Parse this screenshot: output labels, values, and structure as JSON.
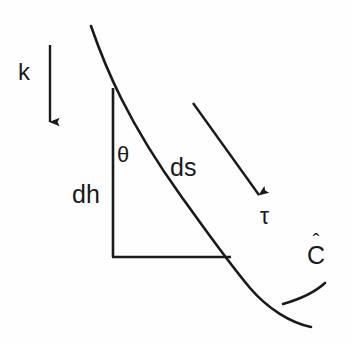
{
  "figure": {
    "type": "line-diagram",
    "background_color": "#fefefe",
    "stroke_color": "#1a1a1a",
    "labels": {
      "k": "k",
      "dh": "dh",
      "theta": "θ",
      "ds": "ds",
      "tau": "τ",
      "c_hat_base": "C",
      "c_hat_accent": "ˆ"
    },
    "geometry": {
      "curve_start": [
        91,
        26
      ],
      "curve_end": [
        311,
        327
      ],
      "triangle_apex": [
        113,
        88
      ],
      "triangle_corner": [
        113,
        257
      ],
      "triangle_right": [
        230,
        257
      ],
      "k_arrow_from": [
        50,
        45
      ],
      "k_arrow_to": [
        50,
        127
      ],
      "tau_arrow_from": [
        193,
        103
      ],
      "tau_arrow_to": [
        263,
        202
      ],
      "c_hat_tick_from": [
        284,
        303
      ],
      "c_hat_tick_to": [
        325,
        285
      ]
    }
  }
}
